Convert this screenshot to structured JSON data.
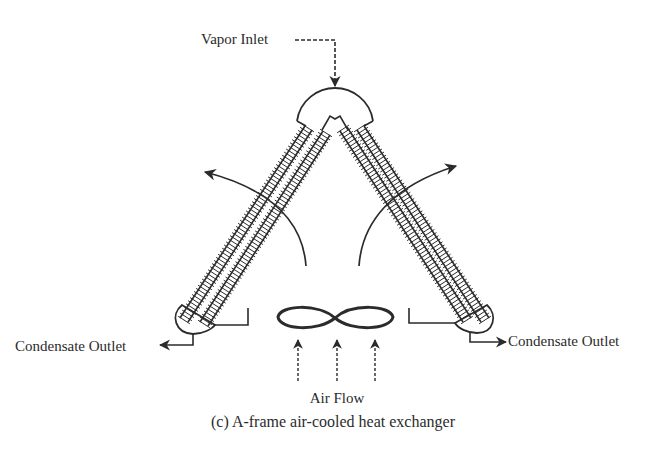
{
  "labels": {
    "vapor_inlet": "Vapor Inlet",
    "condensate_outlet_left": "Condensate Outlet",
    "condensate_outlet_right": "Condensate Outlet",
    "air_flow": "Air Flow",
    "caption": "(c) A-frame air-cooled heat exchanger"
  },
  "colors": {
    "ink": "#2b2b2b",
    "background": "#ffffff"
  }
}
